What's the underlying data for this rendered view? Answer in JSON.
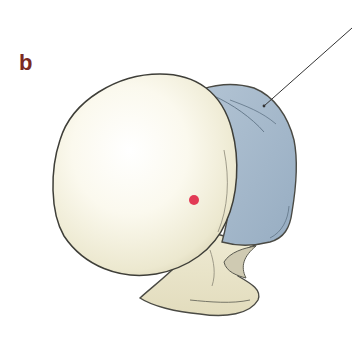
{
  "figure": {
    "panel_label": "b",
    "colors": {
      "label": "#7a2a22",
      "bone_fill": "#f6f3e2",
      "bone_highlight": "#ffffff",
      "bone_shadow": "#d9d4b8",
      "outline": "#4a4a44",
      "blue_region": "#a9bccd",
      "blue_region_shadow": "#8fa6bb",
      "marker": "#e23a55",
      "leader_line": "#333333",
      "background": "#ffffff"
    },
    "elements": {
      "head": "spherical articular head",
      "highlighted_region": "blue shaded region",
      "marker": "red point",
      "leader_line": "pointer to blue region"
    }
  }
}
